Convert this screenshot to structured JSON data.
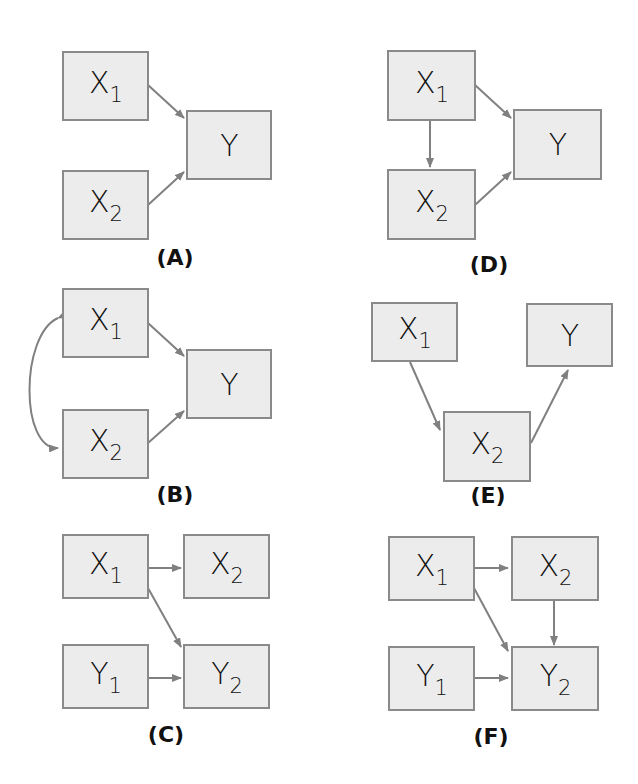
{
  "panels": {
    "A": {
      "label": "(A)",
      "x1": "X",
      "x1_sub": "1",
      "x2": "X",
      "x2_sub": "2",
      "y": "Y"
    },
    "B": {
      "label": "(B)",
      "x1": "X",
      "x1_sub": "1",
      "x2": "X",
      "x2_sub": "2",
      "y": "Y"
    },
    "C": {
      "label": "(C)",
      "x1": "X",
      "x1_sub": "1",
      "x2": "X",
      "x2_sub": "2",
      "y1": "Y",
      "y1_sub": "1",
      "y2": "Y",
      "y2_sub": "2"
    },
    "D": {
      "label": "(D)",
      "x1": "X",
      "x1_sub": "1",
      "x2": "X",
      "x2_sub": "2",
      "y": "Y"
    },
    "E": {
      "label": "(E)",
      "x1": "X",
      "x1_sub": "1",
      "x2": "X",
      "x2_sub": "2",
      "y": "Y"
    },
    "F": {
      "label": "(F)",
      "x1": "X",
      "x1_sub": "1",
      "x2": "X",
      "x2_sub": "2",
      "y1": "Y",
      "y1_sub": "1",
      "y2": "Y",
      "y2_sub": "2"
    }
  },
  "colors": {
    "box_fill": "#ececec",
    "box_border": "#8a8a8a",
    "arrow": "#808080"
  }
}
